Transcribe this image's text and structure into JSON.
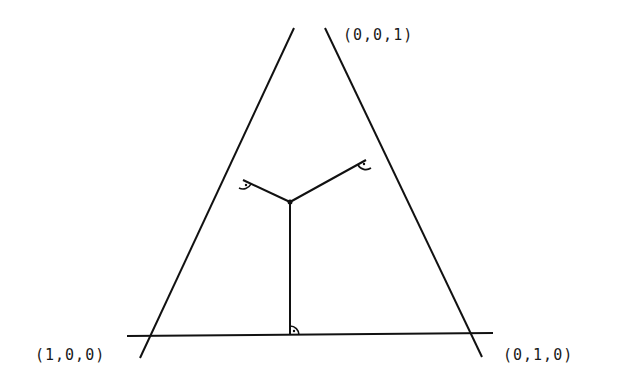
{
  "diagram": {
    "type": "barycentric-simplex",
    "vertices": [
      {
        "id": "top",
        "label": "(0,0,1)"
      },
      {
        "id": "left",
        "label": "(1,0,0)"
      },
      {
        "id": "right",
        "label": "(0,1,0)"
      }
    ],
    "interior_point": {
      "marker": "dot"
    },
    "perpendicular_feet": [
      {
        "side": "left-edge",
        "right_angle_mark": true
      },
      {
        "side": "right-edge",
        "right_angle_mark": true
      },
      {
        "side": "base",
        "right_angle_mark": true
      }
    ],
    "colors": {
      "line": "#111111",
      "background": "#ffffff"
    }
  }
}
